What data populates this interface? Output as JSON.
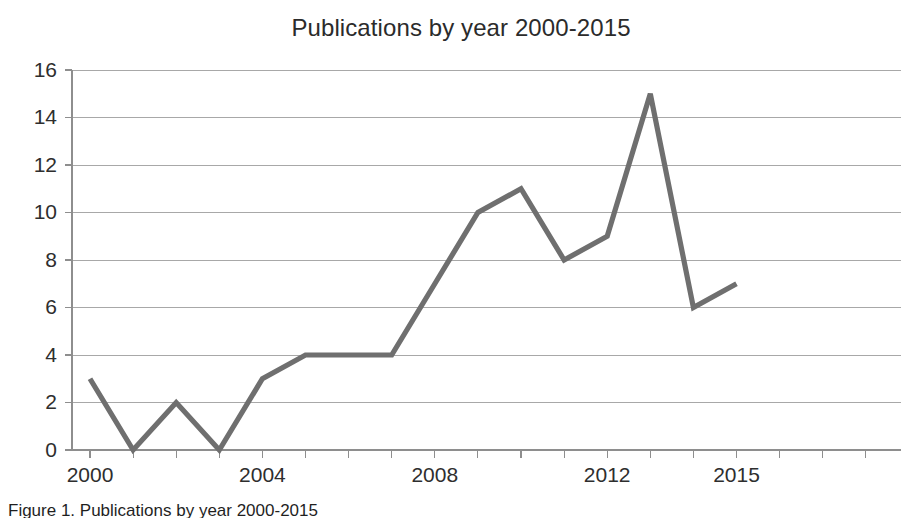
{
  "figure": {
    "caption": "Figure 1. Publications by year 2000-2015"
  },
  "chart_data": {
    "type": "line",
    "title": "Publications by year 2000-2015",
    "xlabel": "",
    "ylabel": "",
    "categories": [
      2000,
      2001,
      2002,
      2003,
      2004,
      2005,
      2006,
      2007,
      2008,
      2009,
      2010,
      2011,
      2012,
      2013,
      2014,
      2015
    ],
    "values": [
      3,
      0,
      2,
      0,
      3,
      4,
      4,
      4,
      7,
      10,
      11,
      8,
      9,
      15,
      6,
      7
    ],
    "x_tick_labels": [
      "2000",
      "2004",
      "2008",
      "2012",
      "2015"
    ],
    "x_tick_values": [
      2000,
      2004,
      2008,
      2012,
      2015
    ],
    "y_tick_labels": [
      "0",
      "2",
      "4",
      "6",
      "8",
      "10",
      "12",
      "14",
      "16"
    ],
    "y_tick_values": [
      0,
      2,
      4,
      6,
      8,
      10,
      12,
      14,
      16
    ],
    "ylim": [
      0,
      16
    ],
    "xlim": [
      2000,
      2019
    ],
    "grid": true,
    "legend": false,
    "series_color": "#6f6f6f",
    "gridline_color": "#9a9a9a",
    "axis_color": "#8e8e8e",
    "max_value": 15,
    "max_year": 2013,
    "min_value": 0,
    "min_years": [
      2001,
      2003
    ]
  }
}
